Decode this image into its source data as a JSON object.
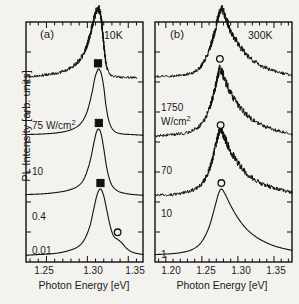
{
  "figure": {
    "axis_titles": {
      "y": "PL Intensity  [arb. units]",
      "x": "Photon Energy  [eV]"
    }
  },
  "panels": [
    {
      "tag": "(a)",
      "temperature": "10K",
      "xlabel": "Photon Energy  [eV]",
      "xticks": [
        "1.25",
        "1.30",
        "1.35"
      ],
      "curve_labels": [
        {
          "line1": "75 W/cm",
          "sup": "2"
        },
        {
          "line1": "10",
          "sup": ""
        },
        {
          "line1": "0.4",
          "sup": ""
        },
        {
          "line1": "0.01",
          "sup": ""
        }
      ]
    },
    {
      "tag": "(b)",
      "temperature": "300K",
      "xlabel": "Photon Energy  [eV]",
      "xticks": [
        "1.20",
        "1.25",
        "1.30",
        "1.35"
      ],
      "curve_labels": [
        {
          "line1": "1750",
          "line2": "W/cm",
          "sup": "2"
        },
        {
          "line1": "70",
          "sup": ""
        },
        {
          "line1": "10",
          "sup": ""
        },
        {
          "line1": "1",
          "sup": ""
        }
      ]
    }
  ],
  "chart_data": {
    "type": "line",
    "title": "",
    "xlabel": "Photon Energy [eV]",
    "ylabel": "PL Intensity [arb. units]",
    "grid": false,
    "legend": "none",
    "stacked_offset_spectra": true,
    "panels": [
      {
        "panel": "(a)",
        "temperature_K": 10,
        "xlim": [
          1.225,
          1.368
        ],
        "xticks_major": [
          1.25,
          1.3,
          1.35
        ],
        "xtick_minor_step": 0.01,
        "series": [
          {
            "name": "75 W/cm2",
            "excitation_W_per_cm2": 75,
            "peak_marker": {
              "shape": "filled-square",
              "x": 1.316,
              "label": "main peak"
            },
            "extra_marker": {
              "shape": "open-circle",
              "x": 1.337,
              "label": "high-energy shoulder"
            },
            "x": [
              1.225,
              1.24,
              1.255,
              1.268,
              1.278,
              1.288,
              1.296,
              1.303,
              1.308,
              1.312,
              1.316,
              1.32,
              1.324,
              1.328,
              1.332,
              1.337,
              1.342,
              1.348,
              1.356,
              1.368
            ],
            "y": [
              0.04,
              0.05,
              0.06,
              0.08,
              0.11,
              0.16,
              0.26,
              0.46,
              0.72,
              0.92,
              1.0,
              0.9,
              0.68,
              0.46,
              0.32,
              0.27,
              0.22,
              0.14,
              0.08,
              0.05
            ]
          },
          {
            "name": "10 W/cm2",
            "excitation_W_per_cm2": 10,
            "peak_marker": {
              "shape": "filled-square",
              "x": 1.314
            },
            "x": [
              1.225,
              1.245,
              1.262,
              1.276,
              1.288,
              1.296,
              1.303,
              1.308,
              1.311,
              1.314,
              1.317,
              1.32,
              1.324,
              1.329,
              1.336,
              1.345,
              1.356,
              1.368
            ],
            "y": [
              0.05,
              0.06,
              0.08,
              0.11,
              0.17,
              0.28,
              0.52,
              0.8,
              0.95,
              1.0,
              0.92,
              0.72,
              0.42,
              0.21,
              0.11,
              0.07,
              0.05,
              0.04
            ]
          },
          {
            "name": "0.4 W/cm2",
            "excitation_W_per_cm2": 0.4,
            "peak_marker": {
              "shape": "filled-square",
              "x": 1.313
            },
            "x": [
              1.225,
              1.248,
              1.266,
              1.28,
              1.291,
              1.299,
              1.305,
              1.309,
              1.312,
              1.314,
              1.317,
              1.32,
              1.323,
              1.327,
              1.333,
              1.342,
              1.354,
              1.368
            ],
            "y": [
              0.05,
              0.06,
              0.08,
              0.12,
              0.2,
              0.36,
              0.62,
              0.86,
              0.97,
              1.0,
              0.93,
              0.74,
              0.45,
              0.22,
              0.1,
              0.06,
              0.05,
              0.04
            ]
          },
          {
            "name": "0.01 W/cm2",
            "excitation_W_per_cm2": 0.01,
            "noisy": true,
            "x": [
              1.225,
              1.245,
              1.262,
              1.277,
              1.289,
              1.298,
              1.304,
              1.308,
              1.311,
              1.313,
              1.315,
              1.317,
              1.319,
              1.321,
              1.323,
              1.326,
              1.33,
              1.336,
              1.345,
              1.36
            ],
            "y": [
              0.02,
              0.04,
              0.07,
              0.13,
              0.24,
              0.42,
              0.66,
              0.86,
              0.96,
              1.0,
              0.97,
              0.85,
              0.62,
              0.38,
              0.2,
              0.09,
              0.04,
              0.02,
              0.01,
              0.01
            ]
          }
        ]
      },
      {
        "panel": "(b)",
        "temperature_K": 300,
        "xlim": [
          1.185,
          1.375
        ],
        "xticks_major": [
          1.2,
          1.25,
          1.3,
          1.35
        ],
        "xtick_minor_step": 0.01,
        "series": [
          {
            "name": "1750 W/cm2",
            "excitation_W_per_cm2": 1750,
            "peak_marker": {
              "shape": "open-circle",
              "x": 1.277
            },
            "x": [
              1.185,
              1.205,
              1.222,
              1.238,
              1.25,
              1.26,
              1.268,
              1.273,
              1.277,
              1.282,
              1.29,
              1.3,
              1.312,
              1.326,
              1.34,
              1.355,
              1.375
            ],
            "y": [
              0.05,
              0.06,
              0.08,
              0.13,
              0.24,
              0.45,
              0.74,
              0.93,
              1.0,
              0.93,
              0.76,
              0.58,
              0.42,
              0.3,
              0.22,
              0.16,
              0.11
            ]
          },
          {
            "name": "70 W/cm2",
            "excitation_W_per_cm2": 70,
            "noisy": true,
            "peak_marker": {
              "shape": "open-circle",
              "x": 1.276
            },
            "x": [
              1.185,
              1.208,
              1.226,
              1.242,
              1.254,
              1.263,
              1.27,
              1.274,
              1.276,
              1.28,
              1.288,
              1.298,
              1.31,
              1.324,
              1.34,
              1.358,
              1.375
            ],
            "y": [
              0.04,
              0.05,
              0.08,
              0.14,
              0.27,
              0.5,
              0.8,
              0.95,
              1.0,
              0.92,
              0.72,
              0.54,
              0.38,
              0.26,
              0.18,
              0.12,
              0.08
            ]
          },
          {
            "name": "10 W/cm2",
            "excitation_W_per_cm2": 10,
            "noisy": true,
            "peak_marker": {
              "shape": "open-circle",
              "x": 1.275
            },
            "x": [
              1.185,
              1.21,
              1.23,
              1.245,
              1.256,
              1.265,
              1.271,
              1.274,
              1.276,
              1.28,
              1.288,
              1.299,
              1.312,
              1.327,
              1.344,
              1.36,
              1.375
            ],
            "y": [
              0.03,
              0.05,
              0.08,
              0.16,
              0.32,
              0.58,
              0.85,
              0.97,
              1.0,
              0.9,
              0.69,
              0.5,
              0.34,
              0.22,
              0.14,
              0.09,
              0.06
            ]
          },
          {
            "name": "1 W/cm2",
            "excitation_W_per_cm2": 1,
            "noisy": true,
            "x": [
              1.185,
              1.212,
              1.232,
              1.246,
              1.257,
              1.266,
              1.272,
              1.275,
              1.278,
              1.283,
              1.291,
              1.302,
              1.315,
              1.33,
              1.348,
              1.365,
              1.375
            ],
            "y": [
              0.02,
              0.03,
              0.06,
              0.14,
              0.32,
              0.6,
              0.86,
              0.97,
              1.0,
              0.88,
              0.66,
              0.47,
              0.31,
              0.19,
              0.11,
              0.06,
              0.04
            ]
          }
        ]
      }
    ]
  }
}
